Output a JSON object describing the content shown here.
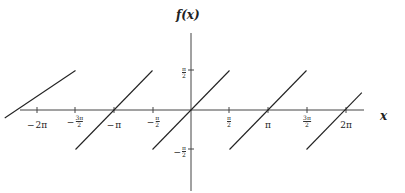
{
  "chart_data": {
    "type": "line",
    "title": "",
    "xlabel": "x",
    "ylabel": "f(x)",
    "xlim": [
      "-5π/2",
      "5π/2"
    ],
    "ylim": [
      "-π",
      "π"
    ],
    "grid": false,
    "legend": null,
    "x_ticks": [
      "−2π",
      "−3π/2",
      "−π",
      "−π/2",
      "π/2",
      "π",
      "3π/2",
      "2π"
    ],
    "y_ticks": [
      "π/2",
      "−π/2"
    ],
    "series": [
      {
        "name": "k=-2",
        "x": [
          -7.6,
          -4.712
        ],
        "y": [
          -0.32,
          1.571
        ]
      },
      {
        "name": "k=-1",
        "x": [
          -4.712,
          -1.571
        ],
        "y": [
          -1.571,
          1.571
        ]
      },
      {
        "name": "k=0",
        "x": [
          -1.571,
          1.571
        ],
        "y": [
          -1.571,
          1.571
        ]
      },
      {
        "name": "k=1",
        "x": [
          1.571,
          4.712
        ],
        "y": [
          -1.571,
          1.571
        ]
      },
      {
        "name": "k=2",
        "x": [
          4.712,
          6.97
        ],
        "y": [
          -1.571,
          0.69
        ]
      }
    ],
    "colors": {
      "line": "#222222",
      "axis": "#444444"
    }
  },
  "labels": {
    "x_axis": "x",
    "y_axis": "f(x)",
    "x_ticks": [
      {
        "neg": true,
        "num": "2π",
        "den": ""
      },
      {
        "neg": true,
        "num": "3π",
        "den": "2"
      },
      {
        "neg": true,
        "num": "π",
        "den": ""
      },
      {
        "neg": true,
        "num": "π",
        "den": "2"
      },
      {
        "neg": false,
        "num": "π",
        "den": "2"
      },
      {
        "neg": false,
        "num": "π",
        "den": ""
      },
      {
        "neg": false,
        "num": "3π",
        "den": "2"
      },
      {
        "neg": false,
        "num": "2π",
        "den": ""
      }
    ],
    "y_ticks": [
      {
        "neg": false,
        "num": "π",
        "den": "2"
      },
      {
        "neg": true,
        "num": "π",
        "den": "2"
      }
    ],
    "minus": "−"
  }
}
